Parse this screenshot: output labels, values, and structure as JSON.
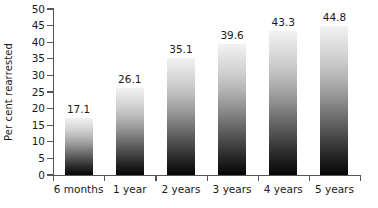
{
  "chart_data": {
    "type": "bar",
    "title": "",
    "subtitle": "",
    "xlabel": "",
    "ylabel": "Per cent rearrested",
    "categories": [
      "6 months",
      "1 year",
      "2 years",
      "3 years",
      "4 years",
      "5 years"
    ],
    "values": [
      17.1,
      26.1,
      35.1,
      39.6,
      43.3,
      44.8
    ],
    "value_labels": [
      "17.1",
      "26.1",
      "35.1",
      "39.6",
      "43.3",
      "44.8"
    ],
    "ylim": [
      0,
      50
    ],
    "ytick_values": [
      0,
      5,
      10,
      15,
      20,
      25,
      30,
      35,
      40,
      45,
      50
    ],
    "ytick_labels": [
      "0",
      "5",
      "10",
      "15",
      "20",
      "25",
      "30",
      "35",
      "40",
      "45",
      "50"
    ],
    "grid": false,
    "legend": null,
    "series": [
      {
        "name": "Per cent rearrested",
        "values": [
          17.1,
          26.1,
          35.1,
          39.6,
          43.3,
          44.8
        ]
      }
    ],
    "bar_fill": "vertical gradient light-grey to black",
    "colors": {
      "bar_top": "#f2f2f2",
      "bar_bottom": "#050505",
      "axis": "#555555",
      "text": "#1a1a1a",
      "background": "#ffffff"
    }
  }
}
